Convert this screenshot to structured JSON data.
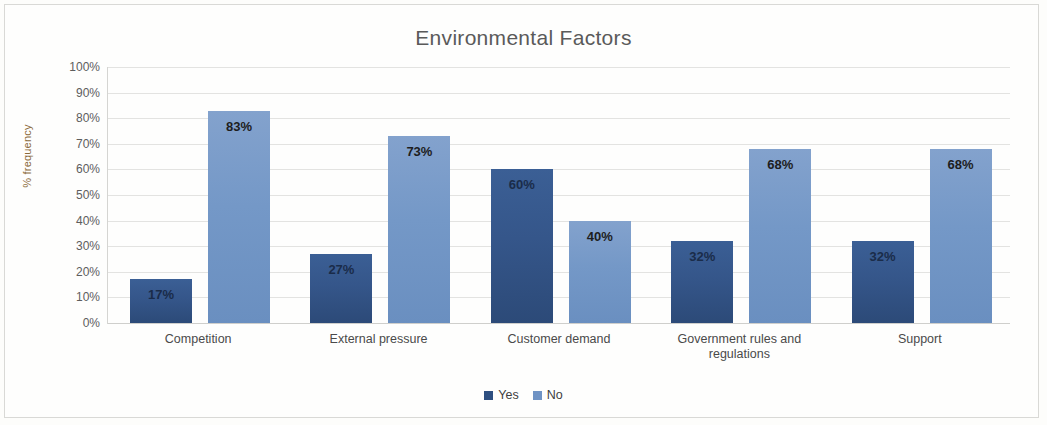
{
  "chart_data": {
    "type": "bar",
    "title": "Environmental Factors",
    "xlabel": "",
    "ylabel": "% frequency",
    "ylim": [
      0,
      100
    ],
    "ytick_labels": [
      "100%",
      "90%",
      "80%",
      "70%",
      "60%",
      "50%",
      "40%",
      "30%",
      "20%",
      "10%",
      "0%"
    ],
    "ytick_values": [
      100,
      90,
      80,
      70,
      60,
      50,
      40,
      30,
      20,
      10,
      0
    ],
    "grid": true,
    "legend_position": "bottom-center",
    "categories": [
      "Competition",
      "External pressure",
      "Customer demand",
      "Government rules and regulations",
      "Support"
    ],
    "category_lines": [
      [
        "Competition"
      ],
      [
        "External pressure"
      ],
      [
        "Customer demand"
      ],
      [
        "Government rules and",
        "regulations"
      ],
      [
        "Support"
      ]
    ],
    "series": [
      {
        "name": "Yes",
        "color": "#2e4f80",
        "values": [
          17,
          27,
          60,
          32,
          32
        ],
        "labels": [
          "17%",
          "27%",
          "60%",
          "32%",
          "32%"
        ]
      },
      {
        "name": "No",
        "color": "#6f93c4",
        "values": [
          83,
          73,
          40,
          68,
          68
        ],
        "labels": [
          "83%",
          "73%",
          "40%",
          "68%",
          "68%"
        ]
      }
    ]
  }
}
